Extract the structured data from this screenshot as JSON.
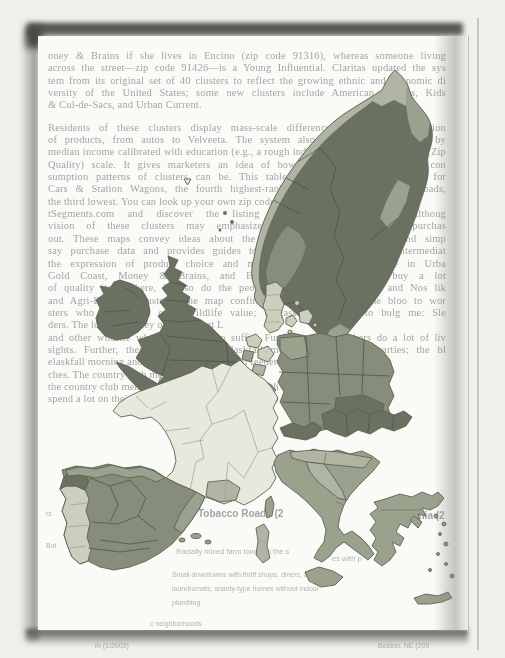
{
  "scan": {
    "background_color": "#eef0ea",
    "page_color": "#fafaf6",
    "shadow_color": "#4a4d44"
  },
  "page": {
    "paragraph1_lines": [
      "oney & Brains if she lives in Encino (zip code 91316), whereas someone living",
      "across the street—zip code 91426—is a Young Influential. Claritas updated the sys",
      "tem from its original set of 40 clusters to reflect the growing ethnic and economic di",
      "versity of the United States; some new clusters include American Dreams, Kids",
      "& Cul-de-Sacs, and Urban Current."
    ],
    "paragraph2_lines": [
      "Residents of these clusters display mass-scale differences in their consumption",
      "of products, from autos to Velveeta. The system also ranks these groupings by",
      "median income calibrated with education (e.g., a rough index of social class) on a ZQ (Zip",
      "Quality) scale. It gives marketers an idea of how dramatically different the con",
      "sumption patterns of clusters can be. This table compares consumption data for",
      "Cars & Station Wagons, the fourth highest-ranking cluster, with Tobacco Roads,",
      "the third lowest. You can look up your own zip code at MyBes",
      "tSegments.com and discover the listing for a different cluster. Althoug",
      "vision of these clusters may emphasize how we take consumer purchas",
      "out. These maps convey ideas about the importance of products beyond simp",
      "say purchase data and provides guides to realis up the market for intermediat",
      "the expression of product choice and maturity). That is, the people in Urba",
      "Gold Coast, Money & Brains, and Blue-Blood Estates clusters buy a lot",
      "of quality items there, but so do the people in the Winners Circle and Nos lik",
      "and Agri-Business clusters. The map confirms that it groups the the bloo to wor",
      "sters who worth and other wildlife value; it gassed the them to bulg me: Sle",
      "ders. The lot in that they own group at L",
      "and other wildlife which in their own suffix. Further retired teachers do a lot of liv",
      "sights. Further, they need them in elaskfall morning and control parties; the bl",
      "elaskfall morning and control parties; the bird feeders usual",
      "ches. The country club me",
      "the country club members and the bird watchers both",
      "spend a lot on their gardens and the yards there"
    ]
  },
  "fragments": {
    "left_edge_1": "rs",
    "left_edge_2": "Bot",
    "cluster_heading": "Tobacco Roads (2",
    "cluster_heading_right": "ps Virginia (2",
    "row1": "Racially mixed farm towns in the s",
    "row2_right": "es with p",
    "desc1": "Small downtowns with thrift shops, diners, and",
    "desc2": "laundromats; shanty-type homes without indoor",
    "desc3": "plumbing",
    "footer_row": "c neighborhoods",
    "below_left": "m (1/2003)",
    "below_right": "Beldon, NE (200"
  },
  "map": {
    "shades": {
      "lightest": "#e7e9dc",
      "light": "#cbcfbc",
      "medium_light": "#b0b5a3",
      "medium": "#9aa18c",
      "medium_dark": "#868d7a",
      "dark": "#6a7160"
    },
    "regions": {
      "scandinavia-base": "dark",
      "norway-coast": "medium_light",
      "norway-north": "medium_light",
      "norway-northeast": "medium",
      "norway-south-interior": "medium_dark",
      "sweden-east-patch": "medium",
      "sweden-south-tip": "medium",
      "denmark": "light",
      "uk": "dark",
      "shetland": "dark",
      "ireland": "dark",
      "netherlands-a": "light",
      "netherlands-b": "light",
      "netherlands-c": "medium",
      "netherlands-d": "medium_light",
      "belgium": "medium",
      "belgium-west": "light",
      "luxembourg": "medium_dark",
      "germany": "medium_dark",
      "germany-northwest": "medium",
      "bavaria": "dark",
      "france": "lightest",
      "france-south-patch": "medium_light",
      "corsica": "medium",
      "iberia": "medium_dark",
      "portugal": "light",
      "galicia": "dark",
      "spain-north-coast": "medium",
      "spain-east-patch": "medium",
      "balearics": "medium",
      "italy": "medium",
      "po-valley": "medium_light",
      "italy-center": "medium_light",
      "sicily": "medium",
      "sardinia": "medium_light",
      "switzerland": "dark",
      "austria": "dark",
      "greece": "medium",
      "greek-islands": "medium",
      "crete": "medium",
      "faroe-mark": "lightest"
    }
  }
}
